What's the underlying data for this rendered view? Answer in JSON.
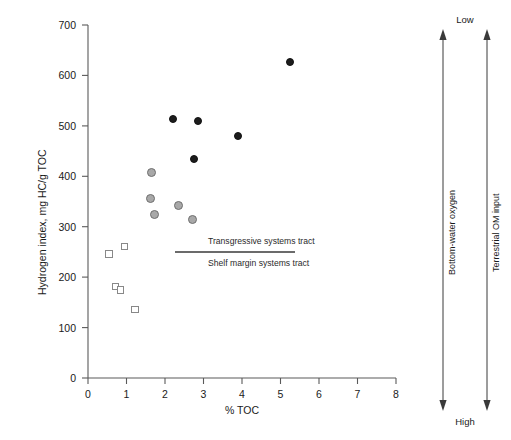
{
  "chart_data": {
    "type": "scatter",
    "title": "",
    "xlabel": "% TOC",
    "ylabel": "Hydrogen index, mg HC/g TOC",
    "xlim": [
      0,
      8
    ],
    "ylim": [
      0,
      700
    ],
    "xticks": [
      "0",
      "1",
      "2",
      "3",
      "4",
      "5",
      "6",
      "7",
      "8"
    ],
    "yticks": [
      "0",
      "100",
      "200",
      "300",
      "400",
      "500",
      "600",
      "700"
    ],
    "grid": false,
    "legend_position": "none",
    "series": [
      {
        "name": "filled-black-circles",
        "marker": "filled-circle",
        "color": "#1c1c1c",
        "points": [
          {
            "x": 2.2,
            "y": 513
          },
          {
            "x": 2.85,
            "y": 510
          },
          {
            "x": 3.9,
            "y": 480
          },
          {
            "x": 2.75,
            "y": 435
          },
          {
            "x": 5.25,
            "y": 627
          }
        ]
      },
      {
        "name": "gray-circles",
        "marker": "filled-circle",
        "color": "#a8a8a8",
        "points": [
          {
            "x": 1.65,
            "y": 408
          },
          {
            "x": 1.62,
            "y": 355
          },
          {
            "x": 1.72,
            "y": 325
          },
          {
            "x": 2.35,
            "y": 343
          },
          {
            "x": 2.72,
            "y": 315
          }
        ]
      },
      {
        "name": "open-squares",
        "marker": "open-square",
        "color": "#888888",
        "points": [
          {
            "x": 0.55,
            "y": 246
          },
          {
            "x": 0.95,
            "y": 261
          },
          {
            "x": 0.72,
            "y": 181
          },
          {
            "x": 0.85,
            "y": 175
          },
          {
            "x": 1.22,
            "y": 136
          }
        ]
      }
    ],
    "annotations": [
      {
        "name": "transgressive-systems-tract",
        "text": "Transgressive systems tract"
      },
      {
        "name": "shelf-margin-systems-tract",
        "text": "Shelf margin systems tract"
      }
    ],
    "side_axes": [
      {
        "name": "bottom-water-oxygen",
        "label": "Bottom-water oxygen",
        "top_label": "Low",
        "bottom_label": "High"
      },
      {
        "name": "terrestrial-om-input",
        "label": "Terrestrial OM input",
        "top_label": "Low",
        "bottom_label": "High"
      }
    ],
    "shared_end_labels": {
      "top": "Low",
      "bottom": "High"
    }
  },
  "axes": {
    "x_title": "% TOC",
    "y_title": "Hydrogen index, mg HC/g TOC"
  },
  "xticklabels": [
    "0",
    "1",
    "2",
    "3",
    "4",
    "5",
    "6",
    "7",
    "8"
  ],
  "yticklabels": [
    "0",
    "100",
    "200",
    "300",
    "400",
    "500",
    "600",
    "700"
  ],
  "annotations": {
    "upper": "Transgressive systems tract",
    "lower": "Shelf margin systems tract"
  },
  "side": {
    "top_label": "Low",
    "bottom_label": "High",
    "left_arrow_label": "Bottom-water oxygen",
    "right_arrow_label": "Terrestrial OM input"
  },
  "colors": {
    "filled": "#1c1c1c",
    "gray": "#a8a8a8",
    "open_border": "#888888",
    "axis": "#4a4a4a"
  }
}
